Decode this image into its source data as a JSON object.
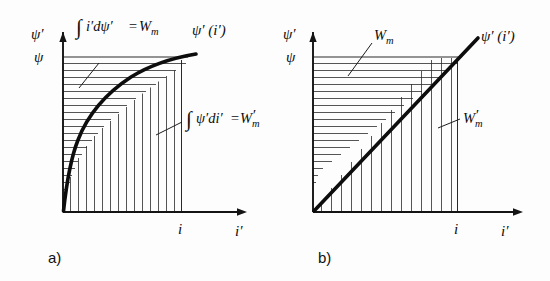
{
  "figure": {
    "background_color": "#fdfdfd",
    "ink_color": "#0d0d0d"
  },
  "panels": [
    {
      "id": "a",
      "caption": "a)",
      "curve_type": "saturating",
      "y_axis_label": "ψ′",
      "y_tick_label": "ψ",
      "x_axis_label": "i′",
      "x_tick_label": "i",
      "curve_label": "ψ′ (i′)",
      "upper_region": {
        "integral_sign": "∫",
        "integrand": "i′dψ′",
        "equals": "=",
        "result": "W",
        "result_sub": "m",
        "result_prime": "",
        "full_text": "∫i′dψ′ = Wₘ",
        "hatch": "horizontal"
      },
      "lower_region": {
        "integral_sign": "∫",
        "integrand": "ψ′di′",
        "equals": "=",
        "result": "W",
        "result_sub": "m",
        "result_prime": "′",
        "full_text": "∫ψ′di′ = W′ₘ",
        "hatch": "vertical"
      }
    },
    {
      "id": "b",
      "caption": "b)",
      "curve_type": "linear",
      "y_axis_label": "ψ′",
      "y_tick_label": "ψ",
      "x_axis_label": "i′",
      "x_tick_label": "i",
      "curve_label": "ψ′ (i′)",
      "upper_region": {
        "integral_sign": "",
        "integrand": "",
        "equals": "",
        "result": "W",
        "result_sub": "m",
        "result_prime": "",
        "full_text": "Wₘ",
        "hatch": "horizontal"
      },
      "lower_region": {
        "integral_sign": "",
        "integrand": "",
        "equals": "",
        "result": "W",
        "result_sub": "m",
        "result_prime": "′",
        "full_text": "W′ₘ",
        "hatch": "vertical"
      }
    }
  ]
}
